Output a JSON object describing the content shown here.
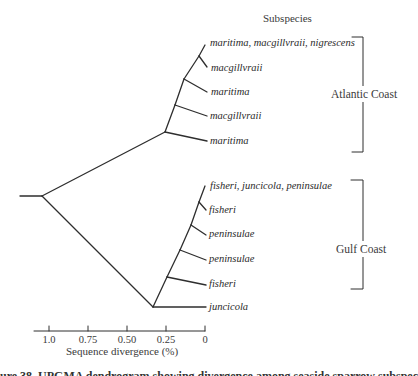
{
  "header": {
    "subspecies_label": "Subspecies"
  },
  "groups": {
    "atlantic": {
      "label": "Atlantic Coast"
    },
    "gulf": {
      "label": "Gulf Coast"
    }
  },
  "leaves": [
    {
      "label": "maritima, macgillvraii, nigrescens",
      "group": "atlantic"
    },
    {
      "label": "macgillvraii",
      "group": "atlantic"
    },
    {
      "label": "maritima",
      "group": "atlantic"
    },
    {
      "label": "macgillvraii",
      "group": "atlantic"
    },
    {
      "label": "maritima",
      "group": "atlantic"
    },
    {
      "label": "fisheri, juncicola, peninsulae",
      "group": "gulf"
    },
    {
      "label": "fisheri",
      "group": "gulf"
    },
    {
      "label": "peninsulae",
      "group": "gulf"
    },
    {
      "label": "peninsulae",
      "group": "gulf"
    },
    {
      "label": "fisheri",
      "group": "gulf"
    },
    {
      "label": "juncicola",
      "group": "gulf"
    }
  ],
  "axis": {
    "label": "Sequence divergence (%)",
    "ticks": [
      "1.0",
      "0.75",
      "0.50",
      "0.25",
      "0"
    ]
  },
  "caption": {
    "text": "ure 38. UPGMA dendrogram showing divergence among seaside sparrow subspecies"
  },
  "colors": {
    "line": "#2e2e2e",
    "background": "#ffffff"
  }
}
